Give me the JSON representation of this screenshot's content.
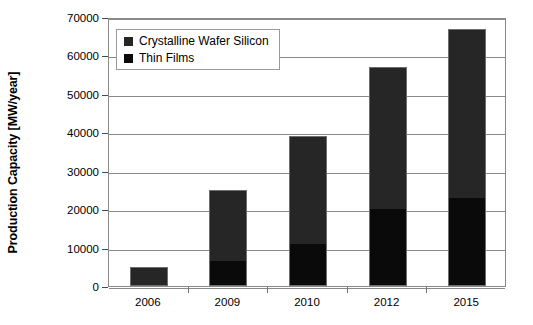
{
  "chart_data": {
    "type": "bar",
    "stacked": true,
    "title": "",
    "xlabel": "",
    "ylabel": "Production Capacity [MW/year]",
    "categories": [
      "2006",
      "2009",
      "2010",
      "2012",
      "2015"
    ],
    "series": [
      {
        "name": "Thin Films",
        "color": "#0a0a0a",
        "values": [
          0,
          6500,
          11000,
          20000,
          23000
        ]
      },
      {
        "name": "Crystalline Wafer Silicon",
        "color": "#262626",
        "values": [
          5000,
          18500,
          28000,
          37000,
          44000
        ]
      }
    ],
    "totals": [
      5000,
      25000,
      39000,
      57000,
      67000
    ],
    "ylim": [
      0,
      70000
    ],
    "yticks": [
      0,
      10000,
      20000,
      30000,
      40000,
      50000,
      60000,
      70000
    ],
    "ytick_labels": [
      "0",
      "10000",
      "20000",
      "30000",
      "40000",
      "50000",
      "60000",
      "70000"
    ],
    "grid": true,
    "legend_position": "top-left",
    "legend_entries": [
      "Crystalline Wafer Silicon",
      "Thin Films"
    ]
  },
  "colors": {
    "crystalline": "#262626",
    "thin_films": "#0a0a0a",
    "grid": "#8a8a8a",
    "axis": "#6e6e6e",
    "background": "#ffffff"
  }
}
